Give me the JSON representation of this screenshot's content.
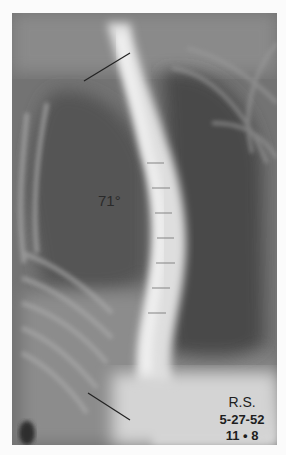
{
  "figure": {
    "type": "radiograph",
    "annotations": {
      "cobb_angle": "71°",
      "patient_initials": "R.S.",
      "date": "5-27-52",
      "age": "11 • 8"
    },
    "colors": {
      "background": "#fbfbfb",
      "film_dark": "#3e3e3e",
      "film_mid": "#6e6e6e",
      "bone_light": "#e8e8e8",
      "text": "#1e1e1e"
    }
  }
}
